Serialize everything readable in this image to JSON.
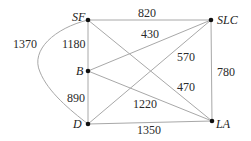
{
  "graph": {
    "nodes": [
      {
        "id": "SF",
        "label": "SF"
      },
      {
        "id": "SLC",
        "label": "SLC"
      },
      {
        "id": "B",
        "label": "B"
      },
      {
        "id": "D",
        "label": "D"
      },
      {
        "id": "LA",
        "label": "LA"
      }
    ],
    "edges": [
      {
        "from": "SF",
        "to": "SLC",
        "weight": "820"
      },
      {
        "from": "SF",
        "to": "B",
        "weight": "1180"
      },
      {
        "from": "B",
        "to": "D",
        "weight": "890"
      },
      {
        "from": "SF",
        "to": "D",
        "weight": "1370",
        "curved": true
      },
      {
        "from": "B",
        "to": "SLC",
        "weight": "430"
      },
      {
        "from": "D",
        "to": "SLC",
        "weight": "570"
      },
      {
        "from": "SLC",
        "to": "LA",
        "weight": "780"
      },
      {
        "from": "SF",
        "to": "LA",
        "weight": "470"
      },
      {
        "from": "B",
        "to": "LA",
        "weight": "1220"
      },
      {
        "from": "D",
        "to": "LA",
        "weight": "1350"
      }
    ]
  }
}
